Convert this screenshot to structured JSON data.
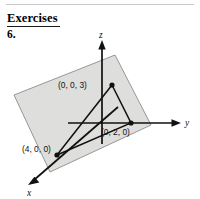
{
  "page": {
    "heading": "Exercises",
    "exercise_number": "6.",
    "background_color": "#ffffff",
    "rule_color": "#c9c9cd"
  },
  "figure": {
    "name": "plane-through-intercepts-3d",
    "plane_fill": "#dededd",
    "plane_stroke": "#8c8c8c",
    "axis_color": "#111111",
    "line_color": "#111111",
    "axes": [
      {
        "name": "z-axis",
        "label": "z",
        "direction": "up"
      },
      {
        "name": "y-axis",
        "label": "y",
        "direction": "right"
      },
      {
        "name": "x-axis",
        "label": "x",
        "direction": "down-left"
      }
    ],
    "points": [
      {
        "name": "z-intercept",
        "label": "(0, 0, 3)",
        "coords": [
          0,
          0,
          3
        ]
      },
      {
        "name": "y-intercept",
        "label": "(0, 2, 0)",
        "coords": [
          0,
          2,
          0
        ]
      },
      {
        "name": "x-intercept",
        "label": "(4, 0, 0)",
        "coords": [
          4,
          0,
          0
        ]
      }
    ]
  }
}
